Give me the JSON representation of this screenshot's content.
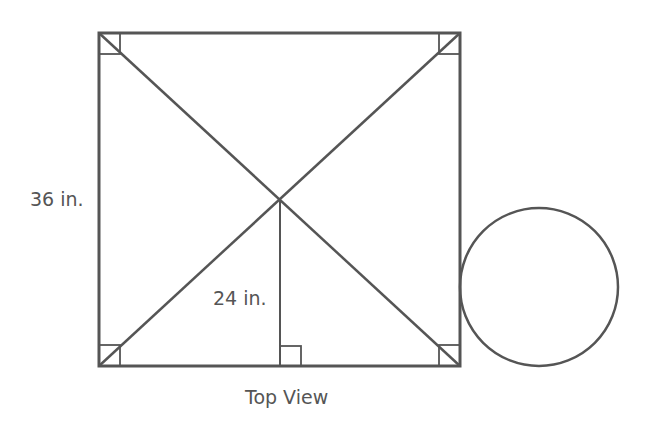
{
  "diagram": {
    "caption": "Top View",
    "labels": {
      "side_length": "36 in.",
      "height_to_center": "24 in."
    },
    "stroke_color": "#555555",
    "square": {
      "x": 99,
      "y": 33,
      "width": 361,
      "height": 333
    },
    "center": {
      "x": 280,
      "y": 200
    },
    "circle": {
      "cx": 539,
      "cy": 287,
      "r": 79
    }
  }
}
